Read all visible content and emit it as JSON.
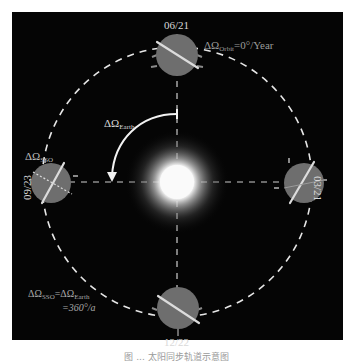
{
  "diagram": {
    "background_color": "#050505",
    "earth_color": "#6e6e6e",
    "orbit_line_color": "#e6e6e6",
    "sun_color": "#ffffff",
    "dates": {
      "top": "06/21",
      "right": "03/21",
      "bottom": "12/22",
      "left": "09/23"
    },
    "labels": {
      "delta_omega_orbit": "ΔΩ",
      "delta_omega_orbit_sub": "Orbit",
      "delta_omega_orbit_value": "=0°/Year",
      "delta_omega_earth": "ΔΩ",
      "delta_omega_earth_sub": "Earth",
      "delta_omega_sso": "ΔΩ",
      "delta_omega_sso_sub": "SSO",
      "equation_lhs": "ΔΩ",
      "equation_lhs_sub": "SSO",
      "equation_eq": "=ΔΩ",
      "equation_rhs_sub": "Earth",
      "equation_line2": "=360°/a"
    }
  },
  "caption": "图 ... 太阳同步轨道示意图"
}
